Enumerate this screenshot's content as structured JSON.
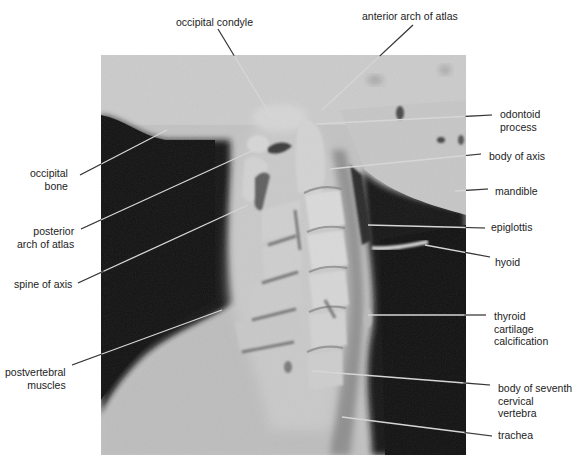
{
  "figure": {
    "image": {
      "x": 101,
      "y": 55,
      "width": 365,
      "height": 400
    },
    "colors": {
      "background": "#ffffff",
      "soft_tissue_light": "#c4c4c4",
      "air_dark": "#141414",
      "bone": "#d8d8d8",
      "leader_line_on_dark": "#d6d6d6",
      "leader_line_on_light": "#333333",
      "text": "#222222"
    }
  },
  "labels": [
    {
      "id": "occipital-condyle",
      "text": "occipital condyle",
      "x": 176,
      "y": 16,
      "align": "left",
      "line": {
        "x1": 218,
        "y1": 29,
        "x2": 272,
        "y2": 118
      }
    },
    {
      "id": "anterior-arch-of-atlas",
      "text": "anterior arch of atlas",
      "x": 362,
      "y": 10,
      "align": "left",
      "line": {
        "x1": 413,
        "y1": 25,
        "x2": 322,
        "y2": 110
      }
    },
    {
      "id": "odontoid-process",
      "text": "odontoid\nprocess",
      "x": 500,
      "y": 108,
      "align": "left",
      "line": {
        "x1": 492,
        "y1": 115,
        "x2": 316,
        "y2": 124
      }
    },
    {
      "id": "body-of-axis",
      "text": "body of axis",
      "x": 489,
      "y": 150,
      "align": "left",
      "line": {
        "x1": 481,
        "y1": 154,
        "x2": 330,
        "y2": 169
      }
    },
    {
      "id": "mandible",
      "text": "mandible",
      "x": 495,
      "y": 185,
      "align": "left",
      "line": {
        "x1": 488,
        "y1": 189,
        "x2": 455,
        "y2": 191
      }
    },
    {
      "id": "occipital-bone",
      "text": "occipital\nbone",
      "x": 30,
      "y": 167,
      "align": "right",
      "line": {
        "x1": 80,
        "y1": 175,
        "x2": 167,
        "y2": 130
      }
    },
    {
      "id": "epiglottis",
      "text": "epiglottis",
      "x": 491,
      "y": 221,
      "align": "left",
      "line": {
        "x1": 485,
        "y1": 228,
        "x2": 368,
        "y2": 225
      }
    },
    {
      "id": "posterior-arch-of-atlas",
      "text": "posterior\narch of atlas",
      "x": 17,
      "y": 225,
      "align": "right",
      "line": {
        "x1": 81,
        "y1": 229,
        "x2": 254,
        "y2": 150
      }
    },
    {
      "id": "hyoid",
      "text": "hyoid",
      "x": 495,
      "y": 256,
      "align": "left",
      "line": {
        "x1": 490,
        "y1": 257,
        "x2": 425,
        "y2": 245
      }
    },
    {
      "id": "spine-of-axis",
      "text": "spine of axis",
      "x": 14,
      "y": 278,
      "align": "left",
      "line": {
        "x1": 78,
        "y1": 283,
        "x2": 248,
        "y2": 205
      }
    },
    {
      "id": "thyroid-cartilage-calcification",
      "text": "thyroid\ncartilage\ncalcification",
      "x": 494,
      "y": 310,
      "align": "left",
      "line": {
        "x1": 486,
        "y1": 315,
        "x2": 368,
        "y2": 315
      }
    },
    {
      "id": "postvertebral-muscles",
      "text": "postvertebral\nmuscles",
      "x": 5,
      "y": 366,
      "align": "right",
      "line": {
        "x1": 72,
        "y1": 365,
        "x2": 222,
        "y2": 310
      }
    },
    {
      "id": "body-of-seventh-cervical-vertebra",
      "text": "body of seventh\ncervical\nvertebra",
      "x": 498,
      "y": 382,
      "align": "left",
      "line": {
        "x1": 490,
        "y1": 385,
        "x2": 312,
        "y2": 371
      }
    },
    {
      "id": "trachea",
      "text": "trachea",
      "x": 498,
      "y": 429,
      "align": "left",
      "line": {
        "x1": 492,
        "y1": 436,
        "x2": 342,
        "y2": 417
      }
    }
  ]
}
